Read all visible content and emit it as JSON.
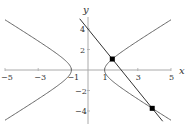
{
  "chart_data": {
    "type": "line",
    "title": "",
    "xlabel": "x",
    "ylabel": "y",
    "xlim": [
      -5,
      5
    ],
    "ylim": [
      -5,
      5
    ],
    "x_ticks": [
      -5,
      -3,
      -1,
      1,
      3,
      5
    ],
    "x_tick_labels": [
      "−5",
      "−3",
      "−1",
      "1",
      "3",
      "5"
    ],
    "y_ticks": [
      -4,
      -2,
      2,
      4
    ],
    "y_tick_labels": [
      "−4",
      "−2",
      "2",
      "4"
    ],
    "grid": false,
    "series": [
      {
        "name": "hyperbola",
        "equation": "x^2 - y^2 = 1",
        "color": "#555555"
      },
      {
        "name": "line",
        "equation": "y = -2x + 4",
        "x": [
          -0.5,
          4.5
        ],
        "y": [
          5,
          -5
        ],
        "color": "#333333"
      }
    ],
    "points": [
      {
        "x": 1.465,
        "y": 1.07,
        "label": ""
      },
      {
        "x": 3.869,
        "y": -3.74,
        "label": ""
      }
    ]
  }
}
